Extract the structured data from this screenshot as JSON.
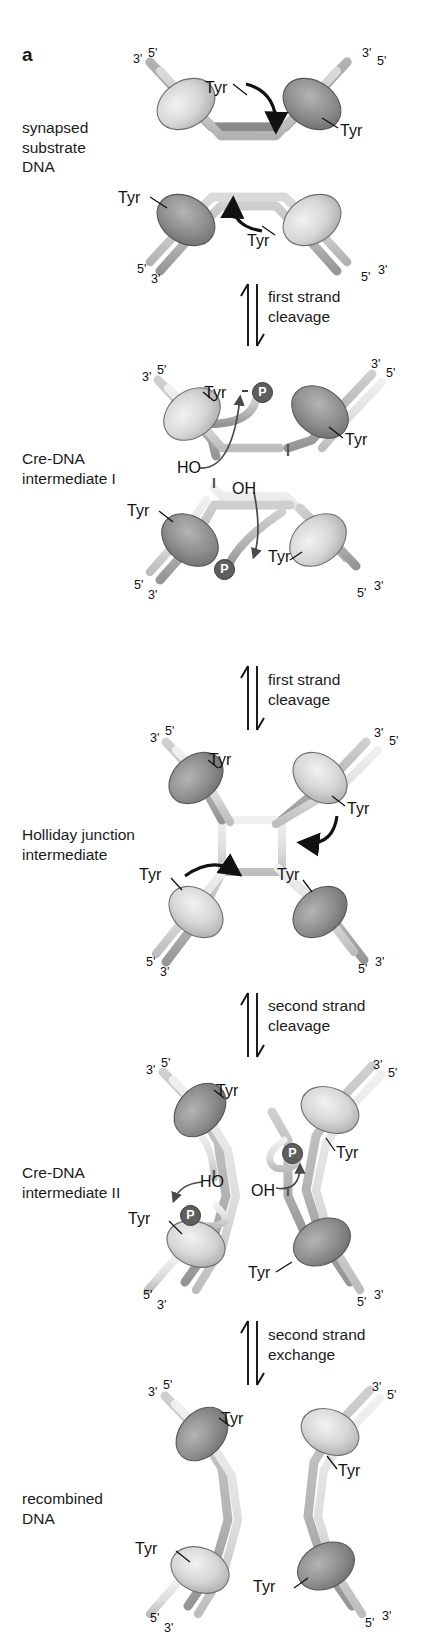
{
  "figure": {
    "panel_letter": "a",
    "background_color": "#ffffff",
    "width": 430,
    "height": 1644
  },
  "colors": {
    "protein_light": "#d9d9d9",
    "protein_dark": "#8e8e8e",
    "dna_light": "#e3e3e3",
    "dna_dark": "#b5b5b5",
    "outline": "#5a5a5a",
    "phosphate": "#5e5e5e",
    "text": "#1b1b1b",
    "arrow": "#111111"
  },
  "stages": [
    {
      "id": "synapsed-substrate-dna",
      "label": "synapsed\nsubstrate\nDNA",
      "x": 22,
      "y": 118
    },
    {
      "id": "cre-dna-intermediate-i",
      "label": "Cre-DNA\nintermediate I",
      "x": 22,
      "y": 449
    },
    {
      "id": "holliday-junction-intermediate",
      "label": "Holliday junction\nintermediate",
      "x": 22,
      "y": 825
    },
    {
      "id": "cre-dna-intermediate-ii",
      "label": "Cre-DNA\nintermediate II",
      "x": 22,
      "y": 1163
    },
    {
      "id": "recombined-dna",
      "label": "recombined\nDNA",
      "x": 22,
      "y": 1489
    }
  ],
  "steps": [
    {
      "id": "first-strand-cleavage-1",
      "label": "first strand\ncleavage",
      "x": 268,
      "y": 287
    },
    {
      "id": "first-strand-cleavage-2",
      "label": "first strand\ncleavage",
      "x": 268,
      "y": 670
    },
    {
      "id": "second-strand-cleavage",
      "label": "second strand\ncleavage",
      "x": 268,
      "y": 996
    },
    {
      "id": "second-strand-exchange",
      "label": "second strand\nexchange",
      "x": 268,
      "y": 1325
    }
  ],
  "labels": {
    "tyr": "Tyr",
    "phosphate": "P",
    "ho": "HO",
    "oh": "OH",
    "three_prime": "3'",
    "five_prime": "5'"
  },
  "tyr_labels": [
    {
      "x": 205,
      "y": 79,
      "id": "tyr-s1-tl"
    },
    {
      "x": 340,
      "y": 122,
      "id": "tyr-s1-tr"
    },
    {
      "x": 118,
      "y": 189,
      "id": "tyr-s1-bl"
    },
    {
      "x": 247,
      "y": 232,
      "id": "tyr-s1-br"
    },
    {
      "x": 204,
      "y": 384,
      "id": "tyr-i1-tl"
    },
    {
      "x": 345,
      "y": 431,
      "id": "tyr-i1-tr"
    },
    {
      "x": 127,
      "y": 502,
      "id": "tyr-i1-bl"
    },
    {
      "x": 268,
      "y": 548,
      "id": "tyr-i1-br"
    },
    {
      "x": 209,
      "y": 751,
      "id": "tyr-hj-tl"
    },
    {
      "x": 347,
      "y": 800,
      "id": "tyr-hj-tr"
    },
    {
      "x": 139,
      "y": 866,
      "id": "tyr-hj-bl"
    },
    {
      "x": 277,
      "y": 866,
      "id": "tyr-hj-br"
    },
    {
      "x": 216,
      "y": 1082,
      "id": "tyr-i2-tl"
    },
    {
      "x": 336,
      "y": 1144,
      "id": "tyr-i2-tr"
    },
    {
      "x": 128,
      "y": 1210,
      "id": "tyr-i2-bl"
    },
    {
      "x": 248,
      "y": 1264,
      "id": "tyr-i2-br"
    },
    {
      "x": 221,
      "y": 1410,
      "id": "tyr-r-tl"
    },
    {
      "x": 338,
      "y": 1462,
      "id": "tyr-r-tr"
    },
    {
      "x": 135,
      "y": 1540,
      "id": "tyr-r-bl"
    },
    {
      "x": 253,
      "y": 1578,
      "id": "tyr-r-br"
    }
  ],
  "phosphate_badges": [
    {
      "x": 252,
      "y": 382,
      "id": "p-i1-top"
    },
    {
      "x": 214,
      "y": 559,
      "id": "p-i1-bottom"
    },
    {
      "x": 282,
      "y": 1143,
      "id": "p-i2-right"
    },
    {
      "x": 180,
      "y": 1205,
      "id": "p-i2-left"
    }
  ],
  "oh_labels": [
    {
      "text": "HO",
      "x": 177,
      "y": 459,
      "id": "ho-i1"
    },
    {
      "text": "OH",
      "x": 232,
      "y": 480,
      "id": "oh-i1"
    },
    {
      "text": "HO",
      "x": 200,
      "y": 1173,
      "id": "ho-i2"
    },
    {
      "text": "OH",
      "x": 251,
      "y": 1182,
      "id": "oh-i2"
    }
  ],
  "prime_labels": [
    {
      "text": "3'",
      "x": 133,
      "y": 52,
      "id": "p-s1-tl3"
    },
    {
      "text": "5'",
      "x": 148,
      "y": 46,
      "id": "p-s1-tl5"
    },
    {
      "text": "3'",
      "x": 362,
      "y": 46,
      "id": "p-s1-tr3"
    },
    {
      "text": "5'",
      "x": 377,
      "y": 54,
      "id": "p-s1-tr5"
    },
    {
      "text": "5'",
      "x": 137,
      "y": 262,
      "id": "p-s1-bl5"
    },
    {
      "text": "3'",
      "x": 151,
      "y": 272,
      "id": "p-s1-bl3"
    },
    {
      "text": "5'",
      "x": 361,
      "y": 270,
      "id": "p-s1-br5"
    },
    {
      "text": "3'",
      "x": 378,
      "y": 263,
      "id": "p-s1-br3"
    },
    {
      "text": "3'",
      "x": 142,
      "y": 370,
      "id": "p-i1-tl3"
    },
    {
      "text": "5'",
      "x": 157,
      "y": 363,
      "id": "p-i1-tl5"
    },
    {
      "text": "3'",
      "x": 371,
      "y": 357,
      "id": "p-i1-tr3"
    },
    {
      "text": "5'",
      "x": 386,
      "y": 366,
      "id": "p-i1-tr5"
    },
    {
      "text": "5'",
      "x": 134,
      "y": 578,
      "id": "p-i1-bl5"
    },
    {
      "text": "3'",
      "x": 148,
      "y": 588,
      "id": "p-i1-bl3"
    },
    {
      "text": "5'",
      "x": 357,
      "y": 586,
      "id": "p-i1-br5"
    },
    {
      "text": "3'",
      "x": 374,
      "y": 579,
      "id": "p-i1-br3"
    },
    {
      "text": "3'",
      "x": 150,
      "y": 731,
      "id": "p-hj-tl3"
    },
    {
      "text": "5'",
      "x": 165,
      "y": 724,
      "id": "p-hj-tl5"
    },
    {
      "text": "3'",
      "x": 374,
      "y": 726,
      "id": "p-hj-tr3"
    },
    {
      "text": "5'",
      "x": 389,
      "y": 734,
      "id": "p-hj-tr5"
    },
    {
      "text": "5'",
      "x": 146,
      "y": 955,
      "id": "p-hj-bl5"
    },
    {
      "text": "3'",
      "x": 160,
      "y": 965,
      "id": "p-hj-bl3"
    },
    {
      "text": "5'",
      "x": 358,
      "y": 962,
      "id": "p-hj-br5"
    },
    {
      "text": "3'",
      "x": 375,
      "y": 955,
      "id": "p-hj-br3"
    },
    {
      "text": "3'",
      "x": 146,
      "y": 1063,
      "id": "p-i2-tl3"
    },
    {
      "text": "5'",
      "x": 161,
      "y": 1056,
      "id": "p-i2-tl5"
    },
    {
      "text": "3'",
      "x": 373,
      "y": 1058,
      "id": "p-i2-tr3"
    },
    {
      "text": "5'",
      "x": 388,
      "y": 1066,
      "id": "p-i2-tr5"
    },
    {
      "text": "5'",
      "x": 143,
      "y": 1288,
      "id": "p-i2-bl5"
    },
    {
      "text": "3'",
      "x": 157,
      "y": 1298,
      "id": "p-i2-bl3"
    },
    {
      "text": "5'",
      "x": 357,
      "y": 1295,
      "id": "p-i2-br5"
    },
    {
      "text": "3'",
      "x": 374,
      "y": 1288,
      "id": "p-i2-br3"
    },
    {
      "text": "3'",
      "x": 148,
      "y": 1385,
      "id": "p-r-tl3"
    },
    {
      "text": "5'",
      "x": 163,
      "y": 1378,
      "id": "p-r-tl5"
    },
    {
      "text": "3'",
      "x": 372,
      "y": 1380,
      "id": "p-r-tr3"
    },
    {
      "text": "5'",
      "x": 387,
      "y": 1388,
      "id": "p-r-tr5"
    },
    {
      "text": "5'",
      "x": 150,
      "y": 1611,
      "id": "p-r-bl5"
    },
    {
      "text": "3'",
      "x": 164,
      "y": 1621,
      "id": "p-r-bl3"
    },
    {
      "text": "5'",
      "x": 365,
      "y": 1616,
      "id": "p-r-br5"
    },
    {
      "text": "3'",
      "x": 382,
      "y": 1609,
      "id": "p-r-br3"
    }
  ]
}
